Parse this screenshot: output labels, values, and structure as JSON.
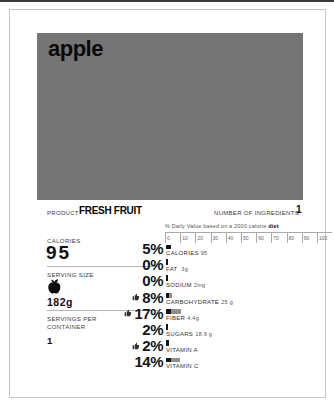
{
  "title": "apple",
  "photo": {
    "placeholder_color": "#757575"
  },
  "product": {
    "label": "PRODUCT",
    "value": "FRESH FRUIT"
  },
  "ingredients": {
    "label": "NUMBER OF INGREDIENTS",
    "value": "1"
  },
  "daily_value": {
    "note": "% Daily Value based on a 2000 calorie",
    "note_bold": "diet",
    "scale_ticks": [
      "0",
      "10",
      "20",
      "30",
      "40",
      "50",
      "60",
      "70",
      "80",
      "90",
      "100"
    ]
  },
  "facts_left": {
    "calories_label": "CALORIES",
    "calories_value": "95",
    "serving_size_label": "SERVING SIZE",
    "serving_size_value": "182g",
    "serving_size_icon": "apple-icon",
    "servings_per_container_label": "SERVINGS PER CONTAINER",
    "servings_per_container_value": "1"
  },
  "rows": [
    {
      "percent": "5%",
      "name": "CALORIES",
      "amount": "95",
      "thumb": false,
      "black_w": 4.5,
      "gray_w": 0,
      "bar_h": 4.5
    },
    {
      "percent": "0%",
      "name": "FAT",
      "amount": ".3g",
      "thumb": false,
      "black_w": 1.5,
      "gray_w": 0,
      "bar_h": 6
    },
    {
      "percent": "0%",
      "name": "SODIUM",
      "amount": "2mg",
      "thumb": false,
      "black_w": 1.5,
      "gray_w": 0,
      "bar_h": 6
    },
    {
      "percent": "8%",
      "name": "CARBOHYDRATE",
      "amount": "25 g",
      "thumb": true,
      "black_w": 3,
      "gray_w": 3,
      "bar_h": 4.5
    },
    {
      "percent": "17%",
      "name": "FIBER",
      "amount": "4.4g",
      "thumb": true,
      "black_w": 5,
      "gray_w": 10,
      "bar_h": 4.5
    },
    {
      "percent": "2%",
      "name": "SUGARS",
      "amount": "18.9 g",
      "thumb": false,
      "black_w": 2,
      "gray_w": 0,
      "bar_h": 6
    },
    {
      "percent": "2%",
      "name": "VITAMIN A",
      "amount": "",
      "thumb": true,
      "black_w": 2.5,
      "gray_w": 0,
      "bar_h": 6
    },
    {
      "percent": "14%",
      "name": "VITAMIN C",
      "amount": "",
      "thumb": false,
      "black_w": 4.5,
      "gray_w": 9,
      "bar_h": 4.5
    }
  ],
  "colors": {
    "photo_gray": "#757575",
    "bar_black": "#151515",
    "bar_gray": "#8f8f8f",
    "border": "#c6c6c6"
  },
  "chart_data": {
    "type": "bar",
    "categories": [
      "CALORIES",
      "FAT",
      "SODIUM",
      "CARBOHYDRATE",
      "FIBER",
      "SUGARS",
      "VITAMIN A",
      "VITAMIN C"
    ],
    "values": [
      5,
      0,
      0,
      8,
      17,
      2,
      2,
      14
    ],
    "amounts": [
      "95",
      ".3g",
      "2mg",
      "25 g",
      "4.4g",
      "18.9 g",
      "",
      ""
    ],
    "xlabel": "% Daily Value based on a 2000 calorie diet",
    "ylabel": "",
    "xlim": [
      0,
      100
    ],
    "axis_ticks": [
      0,
      10,
      20,
      30,
      40,
      50,
      60,
      70,
      80,
      90,
      100
    ],
    "legend": "thumbs-up marks favorable nutrients (CARBOHYDRATE, FIBER, VITAMIN A)",
    "grid": false
  }
}
